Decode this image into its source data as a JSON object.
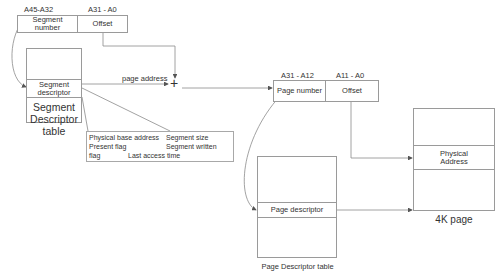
{
  "segment_address": {
    "segment_bits": "A45-A32",
    "offset_bits": "A31  -  A0",
    "segment_field": "Segment\nnumber",
    "offset_field": "Offset"
  },
  "segment_table": {
    "row_label": "Segment\ndescriptor",
    "caption": "Segment\nDescriptor\ntable"
  },
  "segment_descriptor_fields": {
    "line1_left": "Physical base address",
    "line1_right": "Segment size",
    "line2_left": "Present flag",
    "line2_right": "Segment written",
    "line3_left": "flag",
    "line3_right": "Last access time"
  },
  "adder": {
    "symbol": "+",
    "input_label": "page address"
  },
  "linear_address": {
    "page_bits": "A31  -  A12",
    "offset_bits": "A11  -  A0",
    "page_field": "Page number",
    "offset_field": "Offset"
  },
  "page_table": {
    "row_label": "Page descriptor",
    "caption": "Page Descriptor table"
  },
  "page_frame": {
    "row_label": "Physical\nAddress",
    "caption": "4K page"
  },
  "colors": {
    "line": "#8a8a8a",
    "border": "#9a9a9a",
    "text": "#333333",
    "background": "#ffffff"
  }
}
